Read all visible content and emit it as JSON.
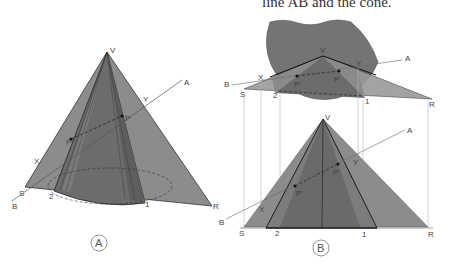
{
  "caption": "line AB and the cone.",
  "figure_a": {
    "id_label": "A",
    "labels": {
      "V": "V",
      "A": "A",
      "B": "B",
      "X": "X",
      "Y": "Y",
      "P": "P",
      "P_prime": "P'",
      "S": "S",
      "R": "R",
      "one": "1",
      "two": "2"
    }
  },
  "figure_b": {
    "id_label": "B",
    "top_view_labels": {
      "V": "V",
      "A": "A",
      "B": "B",
      "X": "X",
      "Y": "Y",
      "P": "P",
      "P_prime": "P'",
      "S": "S",
      "R": "R",
      "one": "1",
      "two": "2"
    },
    "front_view_labels": {
      "V": "V",
      "A": "A",
      "B": "B",
      "X": "X",
      "Y": "Y",
      "P": "P",
      "P_prime": "P'",
      "S": "S",
      "R": "R",
      "one": "1",
      "two": "2"
    }
  },
  "colors": {
    "plane_light": "#8a8a8a",
    "cone_dark": "#6a6a6a",
    "cone_mid": "#7a7a7a",
    "top_disc": "#747474",
    "line": "#222222",
    "projector": "#bbbbbb"
  }
}
